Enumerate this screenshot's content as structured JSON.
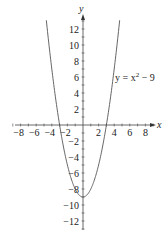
{
  "chart_data": {
    "type": "line",
    "title": "",
    "xlabel": "x",
    "ylabel": "y",
    "xlim": [
      -9,
      9
    ],
    "ylim": [
      -13,
      14
    ],
    "grid": false,
    "x_ticks": [
      -8,
      -6,
      -4,
      -2,
      2,
      4,
      6,
      8
    ],
    "x_tick_labels": [
      "−8",
      "−6",
      "−4",
      "−2",
      "2",
      "4",
      "6",
      "8"
    ],
    "y_ticks": [
      12,
      10,
      8,
      6,
      4,
      2,
      -2,
      -4,
      -6,
      -8,
      -10,
      -12
    ],
    "y_tick_labels": [
      "12",
      "10",
      "8",
      "6",
      "4",
      "2",
      "−2",
      "−4",
      "−6",
      "−8",
      "−10",
      "−12"
    ],
    "series": [
      {
        "name": "y = x^2 - 9",
        "function": "x^2 - 9",
        "x_range": [
          -4.7,
          4.7
        ],
        "x": [
          -4.5,
          -4,
          -3,
          -2,
          -1,
          0,
          1,
          2,
          3,
          4,
          4.5
        ],
        "values": [
          11.25,
          7,
          0,
          -5,
          -8,
          -9,
          -8,
          -5,
          0,
          7,
          11.25
        ]
      }
    ],
    "annotations": [
      {
        "text": "y = x² − 9",
        "x": 4.2,
        "y": 6
      }
    ]
  },
  "labels": {
    "x_axis": "x",
    "y_axis": "y",
    "equation_prefix": "y = x",
    "equation_exp": "2",
    "equation_suffix": " − 9"
  }
}
